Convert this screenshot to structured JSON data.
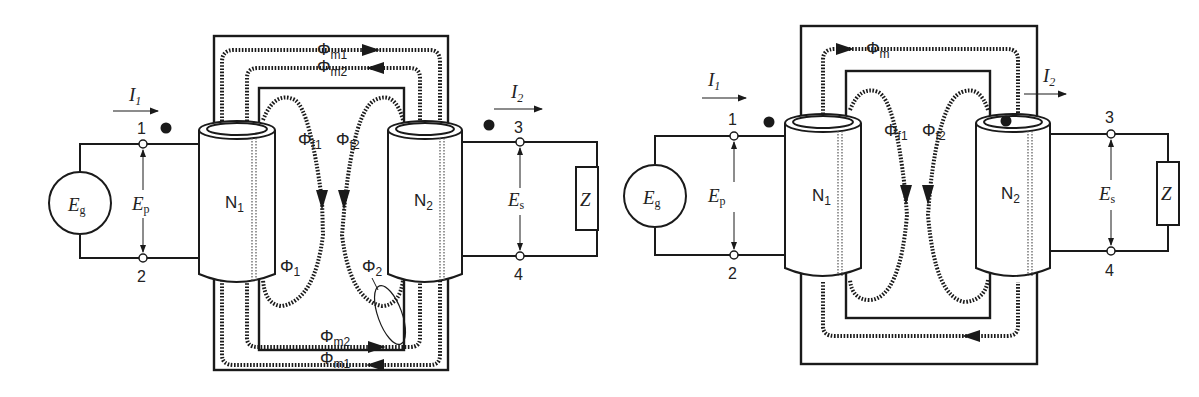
{
  "figures": [
    {
      "id": "left",
      "description": "Transformer with separate mutual fluxes",
      "source": {
        "symbol": "E",
        "sub": "g"
      },
      "primary_voltage": {
        "symbol": "E",
        "sub": "p"
      },
      "secondary_voltage": {
        "symbol": "E",
        "sub": "s"
      },
      "load": "Z",
      "primary_current": {
        "symbol": "I",
        "sub": "1"
      },
      "secondary_current": {
        "symbol": "I",
        "sub": "2"
      },
      "terminals": [
        "1",
        "2",
        "3",
        "4"
      ],
      "coil1": {
        "label": "N",
        "sub": "1"
      },
      "coil2": {
        "label": "N",
        "sub": "2"
      },
      "flux_labels": {
        "m1_top": {
          "sym": "Φ",
          "sub": "m1"
        },
        "m2_top": {
          "sym": "Φ",
          "sub": "m2"
        },
        "f1": {
          "sym": "Φ",
          "sub": "f1"
        },
        "f2": {
          "sym": "Φ",
          "sub": "f2"
        },
        "phi1": {
          "sym": "Φ",
          "sub": "1"
        },
        "phi2": {
          "sym": "Φ",
          "sub": "2"
        },
        "m2_bottom": {
          "sym": "Φ",
          "sub": "m2"
        },
        "m1_bottom": {
          "sym": "Φ",
          "sub": "m1"
        }
      }
    },
    {
      "id": "right",
      "description": "Transformer with net mutual flux",
      "source": {
        "symbol": "E",
        "sub": "g"
      },
      "primary_voltage": {
        "symbol": "E",
        "sub": "p"
      },
      "secondary_voltage": {
        "symbol": "E",
        "sub": "s"
      },
      "load": "Z",
      "primary_current": {
        "symbol": "I",
        "sub": "1"
      },
      "secondary_current": {
        "symbol": "I",
        "sub": "2"
      },
      "terminals": [
        "1",
        "2",
        "3",
        "4"
      ],
      "coil1": {
        "label": "N",
        "sub": "1"
      },
      "coil2": {
        "label": "N",
        "sub": "2"
      },
      "flux_labels": {
        "m": {
          "sym": "Φ",
          "sub": "m"
        },
        "f1": {
          "sym": "Φ",
          "sub": "f1"
        },
        "f2": {
          "sym": "Φ",
          "sub": "f2"
        }
      }
    }
  ]
}
